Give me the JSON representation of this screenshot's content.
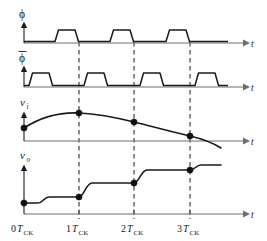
{
  "figure": {
    "background_color": "#ffffff",
    "line_color": "#1a1a1a",
    "axis_color": "#6f6f6f"
  },
  "axes": {
    "time_axis_label": "t",
    "origin_x": 24,
    "arrow_x": 246,
    "tick_labels": [
      {
        "number": "0",
        "symbol": "T",
        "subscript": "CK",
        "x": 24
      },
      {
        "number": "1",
        "symbol": "T",
        "subscript": "CK",
        "x": 79
      },
      {
        "number": "2",
        "symbol": "T",
        "subscript": "CK",
        "x": 134
      },
      {
        "number": "3",
        "symbol": "T",
        "subscript": "CK",
        "x": 190
      }
    ]
  },
  "traces": [
    {
      "name": "phi",
      "label": "ϕ",
      "has_overbar": false,
      "kind": "clock",
      "baseline_y": 43,
      "high_y": 30,
      "description": "Clock phase 1, high during second half of each period",
      "pulses": [
        {
          "rise": 57,
          "fall": 77
        },
        {
          "rise": 112,
          "fall": 132
        },
        {
          "rise": 168,
          "fall": 188
        }
      ]
    },
    {
      "name": "phi-bar",
      "label": "ϕ",
      "has_overbar": true,
      "kind": "clock",
      "baseline_y": 87,
      "high_y": 72,
      "description": "Complementary clock phase, high during first half of each period",
      "pulses": [
        {
          "rise": 31,
          "fall": 51
        },
        {
          "rise": 86,
          "fall": 107
        },
        {
          "rise": 142,
          "fall": 162
        },
        {
          "rise": 197,
          "fall": 218
        }
      ]
    },
    {
      "name": "vi",
      "label": "v",
      "subscript": "i",
      "kind": "analog-input",
      "baseline_y": 141,
      "description": "Continuous sinusoid-like input signal sampled at each clock period",
      "samples": [
        {
          "x": 24,
          "y": 128,
          "t_label": "0T_CK"
        },
        {
          "x": 79,
          "y": 113,
          "t_label": "1T_CK"
        },
        {
          "x": 134,
          "y": 122,
          "t_label": "2T_CK"
        },
        {
          "x": 190,
          "y": 136,
          "t_label": "3T_CK"
        }
      ]
    },
    {
      "name": "vo",
      "label": "v",
      "subscript": "o",
      "kind": "staircase-output",
      "baseline_y": 214,
      "description": "Held output staircase, updates once per clock period",
      "samples": [
        {
          "x": 24,
          "y": 203,
          "t_label": "0T_CK"
        },
        {
          "x": 79,
          "y": 193,
          "t_label": "1T_CK"
        },
        {
          "x": 134,
          "y": 181,
          "t_label": "2T_CK"
        },
        {
          "x": 190,
          "y": 169,
          "t_label": "3T_CK"
        }
      ]
    }
  ],
  "dashed_guides": [
    {
      "x": 79,
      "label": "1T_CK"
    },
    {
      "x": 134,
      "label": "2T_CK"
    },
    {
      "x": 190,
      "label": "3T_CK"
    }
  ]
}
